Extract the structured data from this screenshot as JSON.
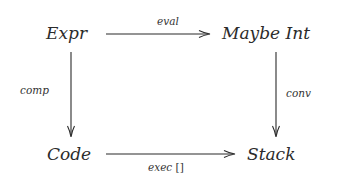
{
  "diagram": {
    "type": "commutative-diagram",
    "nodes": {
      "top_left": "Expr",
      "top_right": "Maybe Int",
      "bottom_left": "Code",
      "bottom_right": "Stack"
    },
    "arrows": {
      "top": {
        "from": "Expr",
        "to": "Maybe Int",
        "label": "eval"
      },
      "left": {
        "from": "Expr",
        "to": "Code",
        "label": "comp"
      },
      "right": {
        "from": "Maybe Int",
        "to": "Stack",
        "label": "conv"
      },
      "bottom": {
        "from": "Code",
        "to": "Stack",
        "label_italic": "exec",
        "label_upright": " []"
      }
    },
    "colors": {
      "ink": "#2b2b2b",
      "background": "#ffffff"
    }
  }
}
